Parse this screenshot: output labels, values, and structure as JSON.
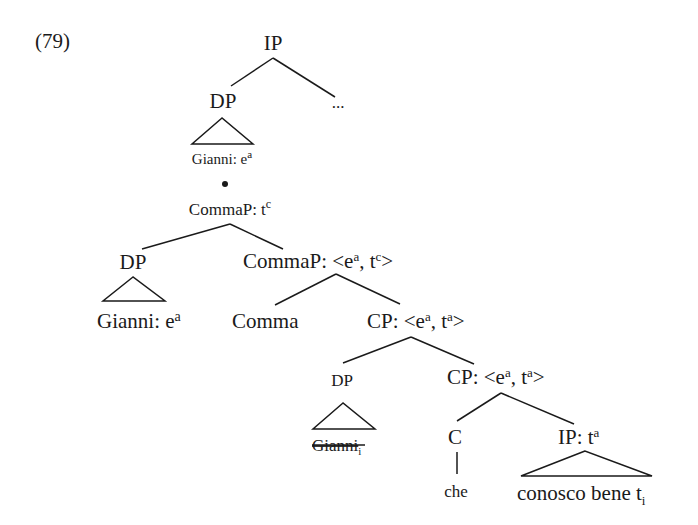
{
  "example_number": "(79)",
  "nodes": {
    "root": {
      "label": "IP"
    },
    "top_dp": {
      "label": "DP"
    },
    "ellipsis": {
      "label": "..."
    },
    "top_dp_leaf": {
      "text": "Gianni: e",
      "sup": "a"
    },
    "bullet": {
      "label": "•"
    },
    "commaP_top": {
      "text": "CommaP: t",
      "sup": "c"
    },
    "dp_left": {
      "label": "DP"
    },
    "dp_left_leaf": {
      "text": "Gianni: e",
      "sup": "a"
    },
    "commaP_bar": {
      "prefix": "CommaP: <e",
      "sup1": "a",
      "mid": ", t",
      "sup2": "c",
      "suffix": ">"
    },
    "comma_head": {
      "label": "Comma"
    },
    "cp_upper": {
      "prefix": "CP: <e",
      "sup1": "a",
      "mid": ", t",
      "sup2": "a",
      "suffix": ">"
    },
    "dp_spec": {
      "label": "DP"
    },
    "dp_spec_leaf": {
      "text": "Gianni",
      "sub": "i",
      "struck": true
    },
    "cp_lower": {
      "prefix": "CP: <e",
      "sup1": "a",
      "mid": ", t",
      "sup2": "a",
      "suffix": ">"
    },
    "c_head": {
      "label": "C"
    },
    "c_leaf": {
      "label": "che"
    },
    "ip_low": {
      "text": "IP: t",
      "sup": "a"
    },
    "ip_low_leaf": {
      "text": "conosco bene t",
      "sub": "i"
    }
  },
  "colors": {
    "ink": "#1a1a1a",
    "background": "#ffffff"
  }
}
